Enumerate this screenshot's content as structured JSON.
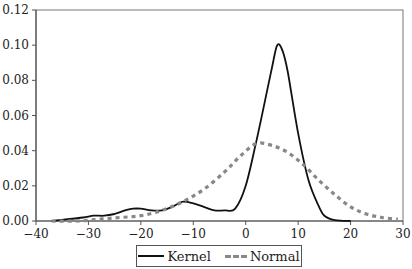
{
  "chart_data": {
    "type": "line",
    "title": "",
    "xlabel": "",
    "ylabel": "",
    "xlim": [
      -40,
      30
    ],
    "ylim": [
      0,
      0.12
    ],
    "x_ticks": [
      "-40",
      "-30",
      "-20",
      "-10",
      "0",
      "10",
      "20",
      "30"
    ],
    "y_ticks": [
      "0.00",
      "0.02",
      "0.04",
      "0.06",
      "0.08",
      "0.10",
      "0.12"
    ],
    "grid": false,
    "legend_position": "bottom",
    "series": [
      {
        "name": "Kernel",
        "style": "solid",
        "color": "#111111",
        "x": [
          -37,
          -34,
          -31,
          -29,
          -27,
          -25,
          -23,
          -21.5,
          -20,
          -18,
          -16,
          -14,
          -12,
          -10,
          -8,
          -6,
          -4,
          -2,
          0,
          2,
          4,
          5,
          6,
          7,
          8,
          10,
          12,
          14,
          15,
          17,
          20
        ],
        "y": [
          0.0,
          0.001,
          0.002,
          0.003,
          0.003,
          0.004,
          0.006,
          0.007,
          0.007,
          0.006,
          0.006,
          0.008,
          0.011,
          0.01,
          0.008,
          0.006,
          0.006,
          0.007,
          0.02,
          0.045,
          0.073,
          0.087,
          0.1,
          0.097,
          0.085,
          0.05,
          0.023,
          0.008,
          0.003,
          0.0005,
          0.0
        ]
      },
      {
        "name": "Normal",
        "style": "dashed",
        "color": "#888888",
        "x": [
          -37,
          -32,
          -28,
          -24,
          -20,
          -16,
          -12,
          -8,
          -4,
          -1,
          2,
          5,
          8,
          11,
          14,
          17,
          20,
          23,
          26,
          29
        ],
        "y": [
          0.0,
          0.0,
          0.001,
          0.002,
          0.003,
          0.006,
          0.011,
          0.018,
          0.028,
          0.037,
          0.044,
          0.043,
          0.039,
          0.032,
          0.023,
          0.015,
          0.008,
          0.004,
          0.002,
          0.001
        ]
      }
    ]
  },
  "legend": {
    "items": [
      {
        "label": "Kernel"
      },
      {
        "label": "Normal"
      }
    ]
  }
}
